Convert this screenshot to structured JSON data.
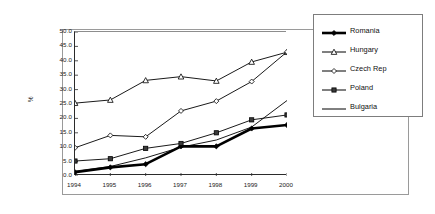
{
  "chart_data": {
    "type": "line",
    "title": "",
    "xlabel": "",
    "ylabel": "%",
    "x": [
      "1994",
      "1995",
      "1996",
      "1997",
      "1998",
      "1999",
      "2000"
    ],
    "categories": [
      "1994",
      "1995",
      "1996",
      "1997",
      "1998",
      "1999",
      "2000"
    ],
    "ylim": [
      0.0,
      50.0
    ],
    "ytick_labels": [
      "50.0",
      "45.0",
      "40.0",
      "35.0",
      "30.0",
      "25.0",
      "20.0",
      "15.0",
      "10.0",
      "5.0",
      "0.0"
    ],
    "ytick_values": [
      50.0,
      45.0,
      40.0,
      35.0,
      30.0,
      25.0,
      20.0,
      15.0,
      10.0,
      5.0,
      0.0
    ],
    "ytick_step": 5.0,
    "grid": false,
    "legend_position": "right",
    "series": [
      {
        "name": "Romania",
        "marker": "filled-diamond",
        "line_width": "thick",
        "color": "#000000",
        "values": [
          1.3,
          3.0,
          4.1,
          10.3,
          10.3,
          16.5,
          17.7
        ]
      },
      {
        "name": "Hungary",
        "marker": "open-triangle",
        "line_width": "thin",
        "color": "#000000",
        "values": [
          25.3,
          26.4,
          33.2,
          34.5,
          33.0,
          39.6,
          43.0
        ]
      },
      {
        "name": "Czech Rep",
        "marker": "open-diamond",
        "line_width": "thin",
        "color": "#000000",
        "values": [
          9.8,
          14.1,
          13.6,
          22.6,
          26.0,
          32.8,
          43.1
        ]
      },
      {
        "name": "Poland",
        "marker": "filled-square",
        "line_width": "thin",
        "color": "#000000",
        "values": [
          5.2,
          6.0,
          9.6,
          11.3,
          15.0,
          19.5,
          21.2
        ]
      },
      {
        "name": "Bulgaria",
        "marker": "none",
        "line_width": "thin",
        "color": "#000000",
        "values": [
          1.7,
          3.3,
          6.3,
          10.0,
          12.5,
          17.0,
          26.2
        ]
      }
    ]
  },
  "legend": {
    "items": [
      {
        "label": "Romania"
      },
      {
        "label": "Hungary"
      },
      {
        "label": "Czech Rep"
      },
      {
        "label": "Poland"
      },
      {
        "label": "Bulgaria"
      }
    ]
  }
}
